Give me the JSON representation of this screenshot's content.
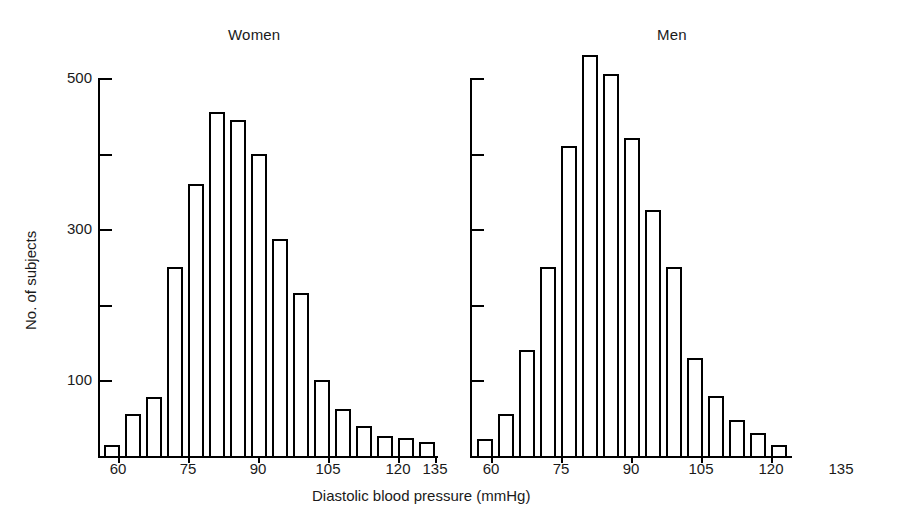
{
  "figure": {
    "xlabel": "Diastolic blood pressure (mmHg)",
    "ylabel": "No. of subjects"
  },
  "panels": [
    {
      "id": "women",
      "title": "Women",
      "y_tick_labels": [
        "100",
        "300",
        "500"
      ],
      "x_tick_labels": [
        "60",
        "75",
        "90",
        "105",
        "120",
        "135"
      ]
    },
    {
      "id": "men",
      "title": "Men",
      "y_tick_labels": [],
      "x_tick_labels": [
        "60",
        "75",
        "90",
        "105",
        "120",
        "135"
      ]
    }
  ],
  "chart_data": {
    "type": "bar",
    "xlabel": "Diastolic blood pressure (mmHg)",
    "ylabel": "No. of subjects",
    "xlim": [
      54,
      136
    ],
    "ylim": [
      0,
      530
    ],
    "grid": false,
    "legend": "none",
    "bin_width": 3,
    "x_ticks": [
      60,
      75,
      90,
      105,
      120,
      135
    ],
    "y_ticks_labeled": [
      100,
      300,
      500
    ],
    "y_ticks_unlabeled": [
      200,
      400
    ],
    "panels": [
      {
        "name": "Women",
        "x": [
          56,
          59,
          62,
          65,
          68,
          71,
          74,
          77,
          80,
          83,
          86,
          89,
          92,
          95,
          98,
          101,
          104,
          107,
          110,
          113,
          116,
          119,
          122,
          125,
          128,
          131,
          134
        ],
        "values": [
          12,
          12,
          55,
          55,
          78,
          78,
          250,
          250,
          360,
          360,
          455,
          455,
          445,
          445,
          400,
          400,
          287,
          287,
          215,
          215,
          100,
          100,
          62,
          62,
          40,
          26,
          24,
          22,
          18,
          18
        ],
        "bars": [
          {
            "bin_start": 55,
            "bin_center": 56.5,
            "value": 12
          },
          {
            "bin_start": 58,
            "bin_center": 59.5,
            "value": 55
          },
          {
            "bin_start": 61,
            "bin_center": 62.5,
            "value": 78
          },
          {
            "bin_start": 64,
            "bin_center": 65.5,
            "value": 0
          },
          {
            "bin_start": 67,
            "bin_center": 68.5,
            "value": 250
          },
          {
            "bin_start": 70,
            "bin_center": 71.5,
            "value": 360
          },
          {
            "bin_start": 73,
            "bin_center": 74.5,
            "value": 455
          },
          {
            "bin_start": 76,
            "bin_center": 77.5,
            "value": 445
          },
          {
            "bin_start": 79,
            "bin_center": 80.5,
            "value": 400
          },
          {
            "bin_start": 82,
            "bin_center": 83.5,
            "value": 287
          },
          {
            "bin_start": 85,
            "bin_center": 86.5,
            "value": 215
          },
          {
            "bin_start": 88,
            "bin_center": 89.5,
            "value": 100
          },
          {
            "bin_start": 91,
            "bin_center": 92.5,
            "value": 62
          },
          {
            "bin_start": 94,
            "bin_center": 95.5,
            "value": 40
          },
          {
            "bin_start": 97,
            "bin_center": 98.5,
            "value": 26
          },
          {
            "bin_start": 100,
            "bin_center": 101.5,
            "value": 24
          },
          {
            "bin_start": 103,
            "bin_center": 104.5,
            "value": 18
          }
        ],
        "series_clean": [
          {
            "bp": 56,
            "n": 12
          },
          {
            "bp": 60,
            "n": 55
          },
          {
            "bp": 63,
            "n": 78
          },
          {
            "bp": 67,
            "n": 250
          },
          {
            "bp": 70,
            "n": 360
          },
          {
            "bp": 73,
            "n": 455
          },
          {
            "bp": 76,
            "n": 445
          },
          {
            "bp": 79,
            "n": 400
          },
          {
            "bp": 83,
            "n": 287
          },
          {
            "bp": 86,
            "n": 215
          },
          {
            "bp": 90,
            "n": 100
          },
          {
            "bp": 93,
            "n": 62
          },
          {
            "bp": 97,
            "n": 40
          },
          {
            "bp": 100,
            "n": 26
          },
          {
            "bp": 104,
            "n": 24
          },
          {
            "bp": 107,
            "n": 18
          },
          {
            "bp": 110,
            "n": 15
          }
        ]
      },
      {
        "name": "Men",
        "series_clean": [
          {
            "bp": 56,
            "n": 22
          },
          {
            "bp": 60,
            "n": 55
          },
          {
            "bp": 63,
            "n": 140
          },
          {
            "bp": 67,
            "n": 250
          },
          {
            "bp": 70,
            "n": 410
          },
          {
            "bp": 73,
            "n": 530
          },
          {
            "bp": 76,
            "n": 505
          },
          {
            "bp": 79,
            "n": 420
          },
          {
            "bp": 83,
            "n": 325
          },
          {
            "bp": 86,
            "n": 250
          },
          {
            "bp": 90,
            "n": 130
          },
          {
            "bp": 93,
            "n": 80
          },
          {
            "bp": 97,
            "n": 48
          },
          {
            "bp": 100,
            "n": 30
          },
          {
            "bp": 104,
            "n": 14
          }
        ]
      }
    ],
    "women_values": [
      12,
      55,
      78,
      250,
      360,
      455,
      445,
      400,
      287,
      215,
      100,
      62,
      40,
      26,
      24,
      18
    ],
    "men_values": [
      22,
      55,
      140,
      250,
      410,
      530,
      505,
      420,
      325,
      250,
      130,
      80,
      48,
      30,
      14
    ]
  },
  "bars_layout": {
    "women": [
      {
        "x": 104,
        "w": 16,
        "v": 14
      },
      {
        "x": 125,
        "w": 16,
        "v": 55
      },
      {
        "x": 146,
        "w": 16,
        "v": 78
      },
      {
        "x": 167,
        "w": 16,
        "v": 250
      },
      {
        "x": 188,
        "w": 16,
        "v": 360
      },
      {
        "x": 209,
        "w": 16,
        "v": 455
      },
      {
        "x": 230,
        "w": 16,
        "v": 445
      },
      {
        "x": 251,
        "w": 16,
        "v": 400
      },
      {
        "x": 272,
        "w": 16,
        "v": 287
      },
      {
        "x": 293,
        "w": 16,
        "v": 215
      },
      {
        "x": 314,
        "w": 16,
        "v": 100
      },
      {
        "x": 335,
        "w": 16,
        "v": 62
      },
      {
        "x": 356,
        "w": 16,
        "v": 40
      },
      {
        "x": 377,
        "w": 16,
        "v": 26
      },
      {
        "x": 398,
        "w": 16,
        "v": 24
      },
      {
        "x": 419,
        "w": 16,
        "v": 18
      }
    ],
    "men": [
      {
        "x": 477,
        "w": 16,
        "v": 22
      },
      {
        "x": 498,
        "w": 16,
        "v": 55
      },
      {
        "x": 519,
        "w": 16,
        "v": 140
      },
      {
        "x": 540,
        "w": 16,
        "v": 250
      },
      {
        "x": 561,
        "w": 16,
        "v": 410
      },
      {
        "x": 582,
        "w": 16,
        "v": 530
      },
      {
        "x": 603,
        "w": 16,
        "v": 505
      },
      {
        "x": 624,
        "w": 16,
        "v": 420
      },
      {
        "x": 645,
        "w": 16,
        "v": 325
      },
      {
        "x": 666,
        "w": 16,
        "v": 250
      },
      {
        "x": 687,
        "w": 16,
        "v": 130
      },
      {
        "x": 708,
        "w": 16,
        "v": 80
      },
      {
        "x": 729,
        "w": 16,
        "v": 48
      },
      {
        "x": 750,
        "w": 16,
        "v": 30
      },
      {
        "x": 771,
        "w": 16,
        "v": 14
      }
    ]
  }
}
